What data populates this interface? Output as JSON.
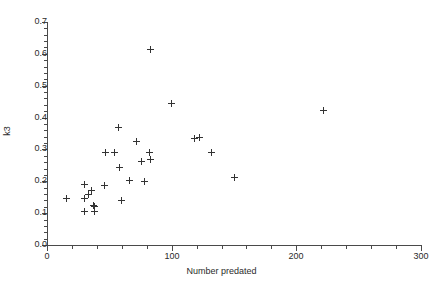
{
  "figure": {
    "background": "#ffffff",
    "marker_color": "#333333",
    "axis_color": "#4a4a4a"
  },
  "chart_data": {
    "type": "scatter",
    "title": "",
    "xlabel": "Number predated",
    "ylabel": "k3",
    "xlim": [
      0,
      300
    ],
    "ylim": [
      0.0,
      0.7
    ],
    "grid": false,
    "legend": null,
    "xticks": [
      0,
      100,
      200,
      300
    ],
    "xtick_labels": [
      "0",
      "100",
      "200",
      "300"
    ],
    "xticks_minor_step": 20,
    "yticks": [
      0.0,
      0.1,
      0.2,
      0.3,
      0.4,
      0.5,
      0.6,
      0.7
    ],
    "ytick_labels": [
      "0.0",
      "0.1",
      "0.2",
      "0.3",
      "0.4",
      "0.5",
      "0.6",
      "0.7"
    ],
    "marker": "plus",
    "points": [
      {
        "x": 16,
        "y": 0.147
      },
      {
        "x": 30,
        "y": 0.19
      },
      {
        "x": 30,
        "y": 0.145
      },
      {
        "x": 30,
        "y": 0.105
      },
      {
        "x": 33,
        "y": 0.16
      },
      {
        "x": 36,
        "y": 0.172
      },
      {
        "x": 37,
        "y": 0.125
      },
      {
        "x": 38,
        "y": 0.122
      },
      {
        "x": 38,
        "y": 0.105
      },
      {
        "x": 46,
        "y": 0.188
      },
      {
        "x": 47,
        "y": 0.29
      },
      {
        "x": 54,
        "y": 0.29
      },
      {
        "x": 57,
        "y": 0.368
      },
      {
        "x": 58,
        "y": 0.243
      },
      {
        "x": 60,
        "y": 0.14
      },
      {
        "x": 66,
        "y": 0.202
      },
      {
        "x": 72,
        "y": 0.326
      },
      {
        "x": 76,
        "y": 0.262
      },
      {
        "x": 78,
        "y": 0.2
      },
      {
        "x": 82,
        "y": 0.29
      },
      {
        "x": 83,
        "y": 0.268
      },
      {
        "x": 83,
        "y": 0.615
      },
      {
        "x": 100,
        "y": 0.445
      },
      {
        "x": 118,
        "y": 0.335
      },
      {
        "x": 122,
        "y": 0.337
      },
      {
        "x": 132,
        "y": 0.29
      },
      {
        "x": 150,
        "y": 0.213
      },
      {
        "x": 222,
        "y": 0.422
      }
    ]
  }
}
